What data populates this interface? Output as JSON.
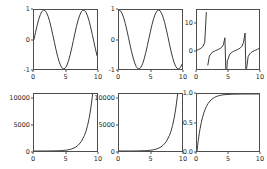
{
  "figure": {
    "width": 267,
    "height": 169,
    "background": "#ffffff",
    "line_color": "#3a3a3a",
    "axis_color": "#4d4d4d",
    "tick_label_color": "#262626",
    "rows": 2,
    "cols": 3
  },
  "chart_data": [
    {
      "type": "line",
      "name": "sine",
      "title": "",
      "xlabel": "",
      "ylabel": "",
      "xlim": [
        0,
        10
      ],
      "ylim": [
        -1,
        1
      ],
      "grid": false,
      "legend": null,
      "xticks": [
        0,
        5,
        10
      ],
      "xtick_labels": [
        "0",
        "5",
        "10"
      ],
      "yticks": [
        -1,
        0,
        1
      ],
      "ytick_labels": [
        "-1",
        "0",
        "1"
      ],
      "expression": "sin(x)",
      "x": [
        0,
        0.25,
        0.5,
        0.75,
        1,
        1.25,
        1.5,
        1.75,
        2,
        2.25,
        2.5,
        2.75,
        3,
        3.25,
        3.5,
        3.75,
        4,
        4.25,
        4.5,
        4.75,
        5,
        5.25,
        5.5,
        5.75,
        6,
        6.25,
        6.5,
        6.75,
        7,
        7.25,
        7.5,
        7.75,
        8,
        8.25,
        8.5,
        8.75,
        9,
        9.25,
        9.5,
        9.75,
        10
      ],
      "y": [
        0,
        0.247,
        0.479,
        0.682,
        0.841,
        0.949,
        0.997,
        0.984,
        0.909,
        0.778,
        0.599,
        0.382,
        0.141,
        -0.108,
        -0.351,
        -0.572,
        -0.757,
        -0.895,
        -0.978,
        -0.999,
        -0.959,
        -0.86,
        -0.706,
        -0.508,
        -0.279,
        -0.034,
        0.215,
        0.45,
        0.657,
        0.82,
        0.938,
        0.994,
        0.989,
        0.923,
        0.798,
        0.625,
        0.412,
        0.174,
        -0.075,
        -0.32,
        -0.544
      ]
    },
    {
      "type": "line",
      "name": "cosine",
      "title": "",
      "xlabel": "",
      "ylabel": "",
      "xlim": [
        0,
        10
      ],
      "ylim": [
        -1,
        1
      ],
      "grid": false,
      "legend": null,
      "xticks": [
        0,
        5,
        10
      ],
      "xtick_labels": [
        "0",
        "5",
        "10"
      ],
      "yticks": [
        -1,
        0,
        1
      ],
      "ytick_labels": [
        "-1",
        "0",
        "1"
      ],
      "expression": "cos(x)",
      "x": [
        0,
        0.25,
        0.5,
        0.75,
        1,
        1.25,
        1.5,
        1.75,
        2,
        2.25,
        2.5,
        2.75,
        3,
        3.25,
        3.5,
        3.75,
        4,
        4.25,
        4.5,
        4.75,
        5,
        5.25,
        5.5,
        5.75,
        6,
        6.25,
        6.5,
        6.75,
        7,
        7.25,
        7.5,
        7.75,
        8,
        8.25,
        8.5,
        8.75,
        9,
        9.25,
        9.5,
        9.75,
        10
      ],
      "y": [
        1,
        0.969,
        0.878,
        0.732,
        0.54,
        0.315,
        0.071,
        -0.178,
        -0.416,
        -0.628,
        -0.801,
        -0.924,
        -0.99,
        -0.994,
        -0.936,
        -0.821,
        -0.654,
        -0.446,
        -0.211,
        0.038,
        0.284,
        0.512,
        0.709,
        0.861,
        0.96,
        0.999,
        0.977,
        0.893,
        0.754,
        0.572,
        0.347,
        0.104,
        -0.146,
        -0.385,
        -0.602,
        -0.781,
        -0.911,
        -0.985,
        -0.997,
        -0.948,
        -0.839
      ]
    },
    {
      "type": "line",
      "name": "tangent",
      "title": "",
      "xlabel": "",
      "ylabel": "",
      "xlim": [
        0,
        10
      ],
      "ylim": [
        -7,
        15
      ],
      "grid": false,
      "legend": null,
      "xticks": [
        0,
        5,
        10
      ],
      "xtick_labels": [
        "0",
        "5",
        "10"
      ],
      "yticks": [
        0,
        10
      ],
      "ytick_labels": [
        "0",
        "10"
      ],
      "expression": "tan(x)",
      "x": [
        0,
        0.25,
        0.5,
        0.75,
        1,
        1.25,
        1.5,
        1.6,
        1.75,
        2,
        2.25,
        2.5,
        2.75,
        3,
        3.25,
        3.5,
        3.75,
        4,
        4.25,
        4.5,
        4.7,
        4.9,
        5,
        5.25,
        5.5,
        5.75,
        6,
        6.25,
        6.5,
        6.75,
        7,
        7.25,
        7.5,
        7.75,
        7.9,
        8,
        8.25,
        8.5,
        8.75,
        9,
        9.25,
        9.5,
        9.75,
        10
      ],
      "y": [
        0,
        0.255,
        0.546,
        0.932,
        1.557,
        3.01,
        14.1,
        -34.2,
        -5.52,
        -2.19,
        -1.29,
        -0.747,
        -0.413,
        -0.143,
        0.112,
        0.375,
        0.697,
        1.158,
        2.005,
        4.637,
        -11.4,
        -3.62,
        -3.38,
        -1.68,
        -0.995,
        -0.59,
        -0.291,
        -0.034,
        0.22,
        0.504,
        0.871,
        1.471,
        2.905,
        6.4,
        -9.2,
        -6.8,
        -2.39,
        -1.38,
        -0.8,
        -0.452,
        -0.185,
        0.0757,
        0.34,
        0.648
      ]
    },
    {
      "type": "line",
      "name": "exponential-left",
      "title": "",
      "xlabel": "",
      "ylabel": "",
      "xlim": [
        0,
        10
      ],
      "ylim": [
        0,
        11000
      ],
      "grid": false,
      "legend": null,
      "xticks": [
        0,
        5,
        10
      ],
      "xtick_labels": [
        "0",
        "5",
        "10"
      ],
      "yticks": [
        0,
        5000,
        10000
      ],
      "ytick_labels": [
        "0",
        "5000",
        "10000"
      ],
      "expression": "exp(x)",
      "x": [
        0,
        0.5,
        1,
        1.5,
        2,
        2.5,
        3,
        3.5,
        4,
        4.5,
        5,
        5.5,
        6,
        6.5,
        7,
        7.5,
        8,
        8.25,
        8.5,
        8.75,
        9,
        9.25,
        9.5,
        9.75,
        10
      ],
      "y": [
        1,
        1.65,
        2.72,
        4.48,
        7.39,
        12.2,
        20.1,
        33.1,
        54.6,
        90,
        148,
        245,
        403,
        665,
        1097,
        1808,
        2981,
        3817,
        4915,
        6310,
        8103,
        10404,
        13360,
        17154,
        22026
      ]
    },
    {
      "type": "line",
      "name": "exponential-middle",
      "title": "",
      "xlabel": "",
      "ylabel": "",
      "xlim": [
        0,
        10
      ],
      "ylim": [
        0,
        11000
      ],
      "grid": false,
      "legend": null,
      "xticks": [
        0,
        5,
        10
      ],
      "xtick_labels": [
        "0",
        "5",
        "10"
      ],
      "yticks": [
        0,
        5000,
        10000
      ],
      "ytick_labels": [
        "0",
        "5000",
        "10000"
      ],
      "expression": "exp(x)",
      "x": [
        0,
        0.5,
        1,
        1.5,
        2,
        2.5,
        3,
        3.5,
        4,
        4.5,
        5,
        5.5,
        6,
        6.5,
        7,
        7.5,
        8,
        8.25,
        8.5,
        8.75,
        9,
        9.25,
        9.5,
        9.75,
        10
      ],
      "y": [
        1,
        1.65,
        2.72,
        4.48,
        7.39,
        12.2,
        20.1,
        33.1,
        54.6,
        90,
        148,
        245,
        403,
        665,
        1097,
        1808,
        2981,
        3817,
        4915,
        6310,
        8103,
        10404,
        13360,
        17154,
        22026
      ]
    },
    {
      "type": "line",
      "name": "saturating",
      "title": "",
      "xlabel": "",
      "ylabel": "",
      "xlim": [
        0,
        10
      ],
      "ylim": [
        0.0,
        1.0
      ],
      "grid": false,
      "legend": null,
      "xticks": [
        0,
        5,
        10
      ],
      "xtick_labels": [
        "0",
        "5",
        "10"
      ],
      "yticks": [
        0.0,
        0.5,
        1.0
      ],
      "ytick_labels": [
        "0.0",
        "0.5",
        "1.0"
      ],
      "expression": "1 - exp(-x)",
      "x": [
        0,
        0.1,
        0.2,
        0.3,
        0.4,
        0.5,
        0.7,
        0.9,
        1.1,
        1.3,
        1.5,
        1.8,
        2.1,
        2.4,
        2.8,
        3.2,
        3.6,
        4,
        4.5,
        5,
        6,
        7,
        8,
        9,
        10
      ],
      "y": [
        0,
        0.095,
        0.181,
        0.259,
        0.33,
        0.393,
        0.503,
        0.593,
        0.667,
        0.727,
        0.777,
        0.835,
        0.878,
        0.909,
        0.939,
        0.959,
        0.973,
        0.982,
        0.989,
        0.993,
        0.9975,
        0.9991,
        0.99966,
        0.99988,
        0.99995
      ]
    }
  ]
}
